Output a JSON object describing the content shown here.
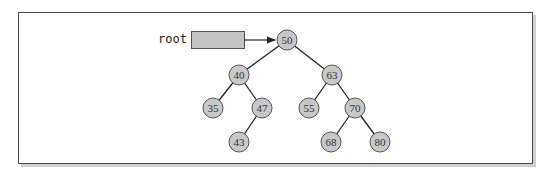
{
  "diagram": {
    "type": "binary-search-tree",
    "root_pointer": {
      "label": "root",
      "points_to": "50"
    },
    "colors": {
      "node_fill": "#c8c8c8",
      "node_stroke": "#555555",
      "edge": "#222222",
      "pointer_box_fill": "#c4c4c4",
      "frame_border": "#4a4a4a"
    },
    "nodes": [
      {
        "id": "n50",
        "value": "50",
        "x": 287,
        "y": 40
      },
      {
        "id": "n40",
        "value": "40",
        "x": 239,
        "y": 75
      },
      {
        "id": "n63",
        "value": "63",
        "x": 332,
        "y": 75
      },
      {
        "id": "n35",
        "value": "35",
        "x": 213,
        "y": 108
      },
      {
        "id": "n47",
        "value": "47",
        "x": 262,
        "y": 108
      },
      {
        "id": "n55",
        "value": "55",
        "x": 309,
        "y": 108
      },
      {
        "id": "n70",
        "value": "70",
        "x": 355,
        "y": 108
      },
      {
        "id": "n43",
        "value": "43",
        "x": 239,
        "y": 142
      },
      {
        "id": "n68",
        "value": "68",
        "x": 331,
        "y": 142
      },
      {
        "id": "n80",
        "value": "80",
        "x": 380,
        "y": 142
      }
    ],
    "edges": [
      {
        "from": "50",
        "to": "40"
      },
      {
        "from": "50",
        "to": "63"
      },
      {
        "from": "40",
        "to": "35"
      },
      {
        "from": "40",
        "to": "47"
      },
      {
        "from": "63",
        "to": "55"
      },
      {
        "from": "63",
        "to": "70"
      },
      {
        "from": "47",
        "to": "43"
      },
      {
        "from": "70",
        "to": "68"
      },
      {
        "from": "70",
        "to": "80"
      }
    ]
  }
}
